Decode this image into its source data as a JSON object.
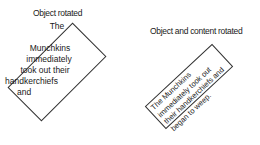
{
  "examples": [
    {
      "caption": "Object rotated",
      "lines": [
        "The",
        "",
        "Munchkins",
        "immediately",
        "took out their",
        "handkerchiefs",
        "and"
      ]
    },
    {
      "caption": "Object and content rotated",
      "lines": [
        "The Munchkins",
        "immediately took out",
        "their handkerchiefs and",
        "began to weep."
      ]
    }
  ]
}
